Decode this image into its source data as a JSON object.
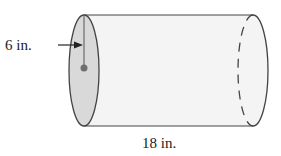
{
  "figure": {
    "shape": "cylinder",
    "radius_label": "6 in.",
    "length_label": "18 in.",
    "colors": {
      "body_fill": "#f4f4f4",
      "end_cap_fill": "#d9d9d9",
      "outline": "#444444",
      "center_dot": "#6e6e6e"
    }
  }
}
